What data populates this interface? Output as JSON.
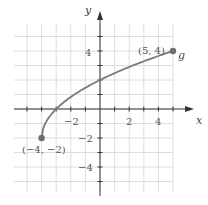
{
  "chart_data": {
    "type": "line",
    "title": "",
    "xlabel": "x",
    "ylabel": "y",
    "xlim": [
      -5,
      6
    ],
    "ylim": [
      -6,
      6
    ],
    "grid": true,
    "x_ticks": [
      -2,
      2,
      4
    ],
    "y_ticks": [
      4,
      -2,
      -4
    ],
    "x_tick_labels": [
      "−2",
      "2",
      "4"
    ],
    "y_tick_labels": [
      "4",
      "−2",
      "−4"
    ],
    "series": [
      {
        "name": "g",
        "description": "square-root shaped curve from (-4,-2) to (5,4)",
        "x": [
          -4,
          -3,
          -2,
          -1,
          0,
          1,
          2,
          3,
          4,
          5
        ],
        "y": [
          -2,
          0,
          0.83,
          1.46,
          2,
          2.47,
          2.9,
          3.29,
          3.66,
          4
        ]
      }
    ],
    "annotations": [
      {
        "text": "(5, 4)",
        "x": 5,
        "y": 4
      },
      {
        "text": "(−4, −2)",
        "x": -4,
        "y": -2
      },
      {
        "text": "g",
        "x": 5,
        "y": 4
      }
    ],
    "colors": {
      "curve": "#7a7a7a",
      "grid": "#d6d6d6",
      "axis": "#333333",
      "point": "#6e6e6e"
    }
  }
}
